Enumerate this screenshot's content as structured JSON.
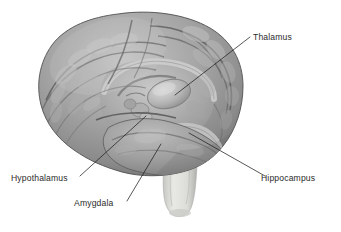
{
  "figure": {
    "view": "left lateral view of cerebrum with brainstem",
    "background_color": "#ffffff",
    "ink_color": "#1f1f1f",
    "text_color": "#2b2b2b",
    "brain_palette": {
      "highlight": "#d3d3d3",
      "light": "#b9b9b9",
      "mid": "#9a9a9a",
      "shade": "#7c7c7c",
      "dark": "#5f5f5f",
      "sulcus": "#4a4a4a",
      "outline": "#3d3d3d",
      "brainstem_light": "#e4e4e2",
      "brainstem_mid": "#cfcfcb",
      "brainstem_shade": "#b0b0ac"
    }
  },
  "labels": [
    {
      "id": "thalamus",
      "text": "Thalamus",
      "text_x": 253,
      "text_y": 40,
      "anchor": "start",
      "leader": {
        "x1": 250,
        "y1": 37,
        "x2": 175,
        "y2": 95
      }
    },
    {
      "id": "hippocampus",
      "text": "Hippocampus",
      "text_x": 261,
      "text_y": 181,
      "anchor": "start",
      "leader": {
        "x1": 265,
        "y1": 176,
        "x2": 189,
        "y2": 133
      }
    },
    {
      "id": "hypothalamus",
      "text": "Hypothalamus",
      "text_x": 11,
      "text_y": 181,
      "anchor": "start",
      "leader": {
        "x1": 80,
        "y1": 176,
        "x2": 146,
        "y2": 116
      }
    },
    {
      "id": "amygdala",
      "text": "Amygdala",
      "text_x": 74,
      "text_y": 206,
      "anchor": "start",
      "leader": {
        "x1": 127,
        "y1": 201,
        "x2": 161,
        "y2": 144
      }
    }
  ]
}
